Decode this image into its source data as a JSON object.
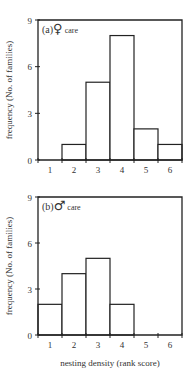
{
  "chart_data": [
    {
      "type": "bar",
      "panel": "(a)",
      "title": "(a)♀ care",
      "title_prefix": "(a)",
      "title_symbol": "♀",
      "title_suffix": "care",
      "categories": [
        "1",
        "2",
        "3",
        "4",
        "5",
        "6"
      ],
      "values": [
        0,
        1,
        5,
        8,
        2,
        1
      ],
      "xlabel": "",
      "ylabel": "frequency (No. of families)",
      "ylim": [
        0,
        9
      ],
      "yticks": [
        "0",
        "3",
        "6",
        "9"
      ],
      "grid": false,
      "legend": "none"
    },
    {
      "type": "bar",
      "panel": "(b)",
      "title": "(b)♂ care",
      "title_prefix": "(b)",
      "title_symbol": "♂",
      "title_suffix": "care",
      "categories": [
        "1",
        "2",
        "3",
        "4",
        "5",
        "6"
      ],
      "values": [
        2,
        4,
        5,
        2,
        0,
        0
      ],
      "xlabel": "nesting density (rank score)",
      "ylabel": "frequency (No. of families)",
      "ylim": [
        0,
        9
      ],
      "yticks": [
        "0",
        "3",
        "6",
        "9"
      ],
      "grid": false,
      "legend": "none"
    }
  ],
  "colors": {
    "line": "#222222",
    "bar_fill": "#ffffff",
    "text": "#333333"
  }
}
